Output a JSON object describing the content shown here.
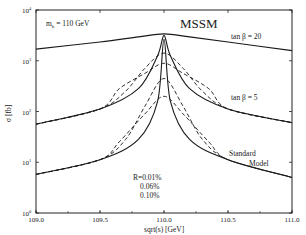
{
  "chart_data": {
    "type": "line",
    "title": "MSSM",
    "annotation_mass": "m_h = 110 GeV",
    "xlabel": "sqrt(s) [GeV]",
    "ylabel": "σ [fb]",
    "xlim": [
      109.0,
      111.0
    ],
    "ylim_log10": [
      0,
      4
    ],
    "x_ticks": [
      "109.0",
      "109.5",
      "110.0",
      "110.5",
      "111.0"
    ],
    "y_ticks": [
      {
        "base": "10",
        "exp": "4"
      },
      {
        "base": "10",
        "exp": "3"
      },
      {
        "base": "10",
        "exp": "2"
      },
      {
        "base": "10",
        "exp": "1"
      },
      {
        "base": "10",
        "exp": "0"
      }
    ],
    "grid": false,
    "curve_labels": {
      "tanb20": "tan β = 20",
      "tanb5": "tan β = 5",
      "sm_line1": "Standard",
      "sm_line2": "Model"
    },
    "resolution_legend": {
      "line1": "R=0.01%",
      "line2": "0.06%",
      "line3": "0.10%"
    },
    "series": [
      {
        "name": "tan β = 20",
        "style": "solid",
        "x": [
          109.0,
          109.5,
          109.8,
          110.0,
          110.2,
          110.5,
          111.0
        ],
        "log10_sigma": [
          3.23,
          3.37,
          3.47,
          3.53,
          3.47,
          3.37,
          3.2
        ]
      },
      {
        "name": "tan β = 5, R=0.01%",
        "style": "solid",
        "x": [
          109.0,
          109.5,
          109.8,
          109.95,
          110.0,
          110.05,
          110.2,
          110.5,
          111.0
        ],
        "log10_sigma": [
          1.75,
          2.05,
          2.45,
          3.1,
          3.5,
          3.1,
          2.45,
          2.05,
          1.78
        ]
      },
      {
        "name": "tan β = 5, R=0.06%",
        "style": "dashed",
        "x": [
          109.0,
          109.5,
          109.7,
          109.85,
          110.0,
          110.15,
          110.3,
          110.5,
          111.0
        ],
        "log10_sigma": [
          1.75,
          2.05,
          2.4,
          2.85,
          3.15,
          2.85,
          2.4,
          2.05,
          1.78
        ]
      },
      {
        "name": "tan β = 5, R=0.10%",
        "style": "dashed",
        "x": [
          109.0,
          109.5,
          109.65,
          109.85,
          110.0,
          110.15,
          110.35,
          110.5,
          111.0
        ],
        "log10_sigma": [
          1.75,
          2.05,
          2.45,
          2.75,
          2.95,
          2.75,
          2.45,
          2.05,
          1.78
        ]
      },
      {
        "name": "Standard Model, R=0.01%",
        "style": "solid",
        "x": [
          109.0,
          109.5,
          109.8,
          109.95,
          110.0,
          110.05,
          110.2,
          110.5,
          111.0
        ],
        "log10_sigma": [
          0.76,
          1.05,
          1.45,
          2.2,
          3.42,
          2.2,
          1.45,
          1.05,
          0.7
        ]
      },
      {
        "name": "Standard Model, R=0.06%",
        "style": "dashed",
        "x": [
          109.0,
          109.5,
          109.7,
          109.85,
          110.0,
          110.15,
          110.3,
          110.5,
          111.0
        ],
        "log10_sigma": [
          0.76,
          1.05,
          1.45,
          2.1,
          2.65,
          2.1,
          1.45,
          1.05,
          0.7
        ]
      },
      {
        "name": "Standard Model, R=0.10%",
        "style": "dashed",
        "x": [
          109.0,
          109.5,
          109.65,
          109.85,
          110.0,
          110.15,
          110.35,
          110.5,
          111.0
        ],
        "log10_sigma": [
          0.76,
          1.05,
          1.4,
          1.95,
          2.3,
          1.95,
          1.4,
          1.05,
          0.7
        ]
      }
    ]
  }
}
